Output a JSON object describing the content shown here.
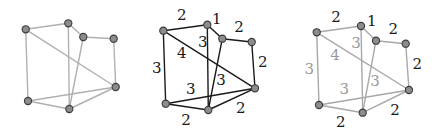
{
  "colors": {
    "node_fill": "#8c8c8c",
    "node_stroke": "#3a3a3a",
    "edge_light": "#b0b0b0",
    "edge_dark": "#1a1a1a",
    "edge_mid": "#a8a8a8",
    "label_dark": "#1a1a1a",
    "label_light": "#9a9a9a"
  },
  "edges": [
    [
      "A",
      "B"
    ],
    [
      "B",
      "C"
    ],
    [
      "C",
      "D"
    ],
    [
      "D",
      "E"
    ],
    [
      "A",
      "E"
    ],
    [
      "A",
      "F"
    ],
    [
      "B",
      "G"
    ],
    [
      "C",
      "G"
    ],
    [
      "F",
      "E"
    ],
    [
      "F",
      "G"
    ],
    [
      "G",
      "E"
    ]
  ],
  "graphs": [
    {
      "id": "unweighted",
      "edge_color_key": "edge_light",
      "edge_width": 1.4,
      "nodes": {
        "A": [
          25.7,
          29.3
        ],
        "B": [
          68.3,
          23.3
        ],
        "C": [
          83.3,
          37.0
        ],
        "D": [
          113.7,
          38.7
        ],
        "E": [
          115.7,
          87.0
        ],
        "F": [
          28.0,
          101.0
        ],
        "G": [
          69.3,
          109.0
        ]
      },
      "labels": []
    },
    {
      "id": "weighted",
      "edge_color_key": "edge_dark",
      "edge_width": 1.4,
      "nodes": {
        "A": [
          163.3,
          30.7
        ],
        "B": [
          207.3,
          24.7
        ],
        "C": [
          222.3,
          38.7
        ],
        "D": [
          251.7,
          42.0
        ],
        "E": [
          255.0,
          88.3
        ],
        "F": [
          165.7,
          103.7
        ],
        "G": [
          208.3,
          110.0
        ]
      },
      "labels": [
        {
          "edge": "A-B",
          "text": "2",
          "x": 181.7,
          "y": 15.0,
          "tone": "dark"
        },
        {
          "edge": "B-C",
          "text": "1",
          "x": 216.7,
          "y": 19.0,
          "tone": "dark"
        },
        {
          "edge": "C-D",
          "text": "2",
          "x": 239.0,
          "y": 26.7,
          "tone": "dark"
        },
        {
          "edge": "B-G",
          "text": "3",
          "x": 202.7,
          "y": 41.7,
          "tone": "dark"
        },
        {
          "edge": "A-E",
          "text": "4",
          "x": 181.7,
          "y": 53.3,
          "tone": "dark"
        },
        {
          "edge": "D-E",
          "text": "2",
          "x": 262.7,
          "y": 61.7,
          "tone": "dark"
        },
        {
          "edge": "A-F",
          "text": "3",
          "x": 156.7,
          "y": 67.7,
          "tone": "dark"
        },
        {
          "edge": "C-G",
          "text": "3",
          "x": 221.0,
          "y": 80.0,
          "tone": "dark"
        },
        {
          "edge": "F-E",
          "text": "3",
          "x": 190.7,
          "y": 89.0,
          "tone": "dark"
        },
        {
          "edge": "G-E",
          "text": "2",
          "x": 240.7,
          "y": 108.3,
          "tone": "dark"
        },
        {
          "edge": "F-G",
          "text": "2",
          "x": 186.0,
          "y": 120.0,
          "tone": "dark"
        }
      ]
    },
    {
      "id": "weighted-highlight",
      "edge_color_key": "edge_mid",
      "edge_width": 1.4,
      "nodes": {
        "A": [
          316.7,
          32.3
        ],
        "B": [
          361.0,
          26.0
        ],
        "C": [
          376.0,
          40.7
        ],
        "D": [
          405.7,
          43.7
        ],
        "E": [
          409.0,
          90.0
        ],
        "F": [
          319.0,
          105.0
        ],
        "G": [
          362.7,
          112.7
        ]
      },
      "labels": [
        {
          "edge": "A-B",
          "text": "2",
          "x": 336.0,
          "y": 17.3,
          "tone": "dark"
        },
        {
          "edge": "B-C",
          "text": "1",
          "x": 371.7,
          "y": 21.0,
          "tone": "dark"
        },
        {
          "edge": "C-D",
          "text": "2",
          "x": 393.3,
          "y": 29.3,
          "tone": "dark"
        },
        {
          "edge": "B-G",
          "text": "3",
          "x": 356.0,
          "y": 42.7,
          "tone": "light"
        },
        {
          "edge": "A-E",
          "text": "4",
          "x": 335.0,
          "y": 55.0,
          "tone": "light"
        },
        {
          "edge": "D-E",
          "text": "2",
          "x": 417.3,
          "y": 64.3,
          "tone": "dark"
        },
        {
          "edge": "A-F",
          "text": "3",
          "x": 309.3,
          "y": 69.3,
          "tone": "light"
        },
        {
          "edge": "C-G",
          "text": "3",
          "x": 375.0,
          "y": 80.7,
          "tone": "light"
        },
        {
          "edge": "F-E",
          "text": "3",
          "x": 344.3,
          "y": 89.3,
          "tone": "light"
        },
        {
          "edge": "G-E",
          "text": "2",
          "x": 395.0,
          "y": 110.0,
          "tone": "dark"
        },
        {
          "edge": "F-G",
          "text": "2",
          "x": 340.7,
          "y": 122.3,
          "tone": "dark"
        }
      ]
    }
  ]
}
